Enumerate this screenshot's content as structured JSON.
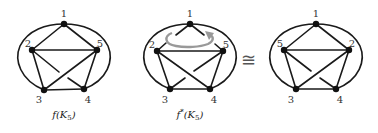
{
  "figure": {
    "graphs": [
      {
        "id": "left",
        "caption": "f(K5)",
        "caption_main": "f(K",
        "caption_sub": "5",
        "caption_close": ")",
        "node_labels": {
          "top": "1",
          "upper_left": "2",
          "upper_right": "5",
          "lower_left": "3",
          "lower_right": "4"
        }
      },
      {
        "id": "middle",
        "caption": "f*(K5)",
        "caption_main": "f",
        "caption_star": "*",
        "caption_rest": "(K",
        "caption_sub": "5",
        "caption_close": ")",
        "node_labels": {
          "top": "1",
          "upper_left": "2",
          "upper_right": "5",
          "lower_left": "3",
          "lower_right": "4"
        },
        "annotation": "rotation-arrow"
      },
      {
        "id": "right",
        "caption": "",
        "node_labels": {
          "top": "1",
          "upper_left": "5",
          "upper_right": "2",
          "lower_left": "3",
          "lower_right": "4"
        }
      }
    ],
    "relation_symbol": "≅",
    "colors": {
      "edge": "#1a1a1a",
      "node": "#111111",
      "arrow": "#999999",
      "background": "#ffffff"
    }
  }
}
